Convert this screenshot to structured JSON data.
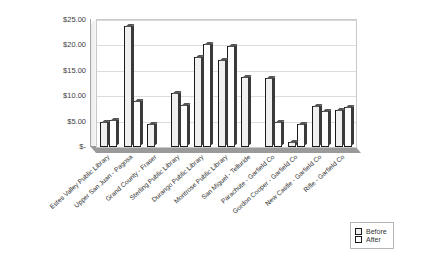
{
  "chart_data": {
    "type": "bar",
    "title": "",
    "xlabel": "",
    "ylabel": "",
    "ylim": [
      0,
      25
    ],
    "ytick_labels": [
      "$25.00",
      "$20.00",
      "$15.00",
      "$10.00",
      "$5.00",
      "$-"
    ],
    "ytick_values": [
      25,
      20,
      15,
      10,
      5,
      0
    ],
    "grid": true,
    "legend_position": "bottom-right",
    "categories": [
      "Estes Valley Public Library",
      "Upper San Juan - Pagosa",
      "Grand County - Fraser",
      "Sterling Public Library",
      "Durango Public Library",
      "Montrose Public Library",
      "San Miguel - Telluride",
      "Parachute - Garfield Co",
      "Gordon Cooper - Garfield Co",
      "New Castle - Garfield Co",
      "Rifle - Garfield Co"
    ],
    "series": [
      {
        "name": "Before",
        "values": [
          5.0,
          23.8,
          4.6,
          10.7,
          17.7,
          17.2,
          13.7,
          13.6,
          1.0,
          8.0,
          7.3
        ]
      },
      {
        "name": "After",
        "values": [
          5.3,
          9.0,
          0,
          8.2,
          20.3,
          19.9,
          0,
          5.0,
          4.6,
          7.0,
          7.8
        ]
      }
    ]
  },
  "legend": {
    "items": [
      {
        "label": "Before"
      },
      {
        "label": "After"
      }
    ]
  }
}
